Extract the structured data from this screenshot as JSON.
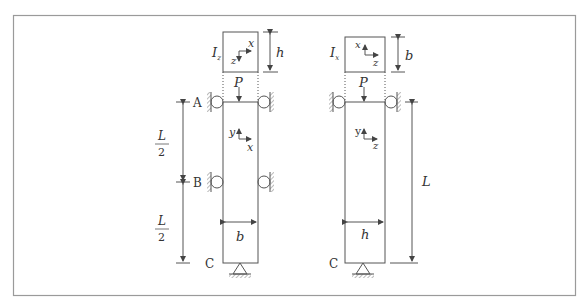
{
  "figure": {
    "frame_color": "#9a9a9a",
    "line_color": "#555555",
    "left_column": {
      "section_inertia_label": "I",
      "section_inertia_sub": "z",
      "section_depth_label": "h",
      "section_axis_up": "x",
      "section_axis_down": "z",
      "load_label": "P",
      "support_A_label": "A",
      "support_B_label": "B",
      "base_label": "C",
      "span_upper_num": "L",
      "span_upper_den": "2",
      "span_lower_num": "L",
      "span_lower_den": "2",
      "local_axis_y": "y",
      "local_axis_x": "x",
      "width_label": "b"
    },
    "right_column": {
      "section_inertia_label": "I",
      "section_inertia_sub": "x",
      "section_depth_label": "b",
      "section_axis_up": "x",
      "section_axis_right": "z",
      "load_label": "P",
      "base_label": "C",
      "span_label": "L",
      "local_axis_y": "y",
      "local_axis_z": "z",
      "width_label": "h"
    }
  }
}
